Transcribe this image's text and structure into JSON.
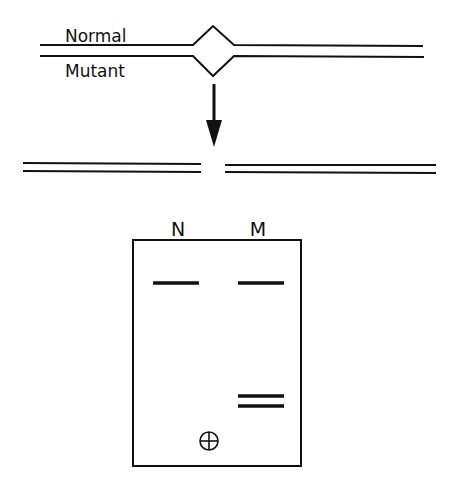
{
  "diagram": {
    "strand_labels": {
      "normal": "Normal",
      "mutant": "Mutant"
    },
    "gel": {
      "lane_labels": {
        "normal": "N",
        "mutant": "M"
      },
      "electrode_symbol": "⊕",
      "lanes": [
        {
          "label": "N",
          "bands": [
            "upper"
          ]
        },
        {
          "label": "M",
          "bands": [
            "upper",
            "lower-a",
            "lower-b"
          ]
        }
      ]
    },
    "colors": {
      "ink": "#111111",
      "background": "#ffffff"
    }
  }
}
